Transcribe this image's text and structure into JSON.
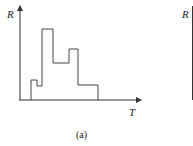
{
  "panel_a": {
    "y_label": "R",
    "x_label": "T",
    "caption": "(a)",
    "axis_color": "#333333",
    "line_color": "#444444",
    "step_points": [
      [
        31,
        100
      ],
      [
        31,
        80
      ],
      [
        37,
        80
      ],
      [
        37,
        86
      ],
      [
        42,
        86
      ],
      [
        42,
        29
      ],
      [
        53,
        29
      ],
      [
        53,
        63
      ],
      [
        69,
        63
      ],
      [
        69,
        49
      ],
      [
        78,
        49
      ],
      [
        78,
        85
      ],
      [
        98,
        85
      ],
      [
        98,
        100
      ]
    ]
  },
  "panel_b_partial": {
    "y_label": "R"
  }
}
